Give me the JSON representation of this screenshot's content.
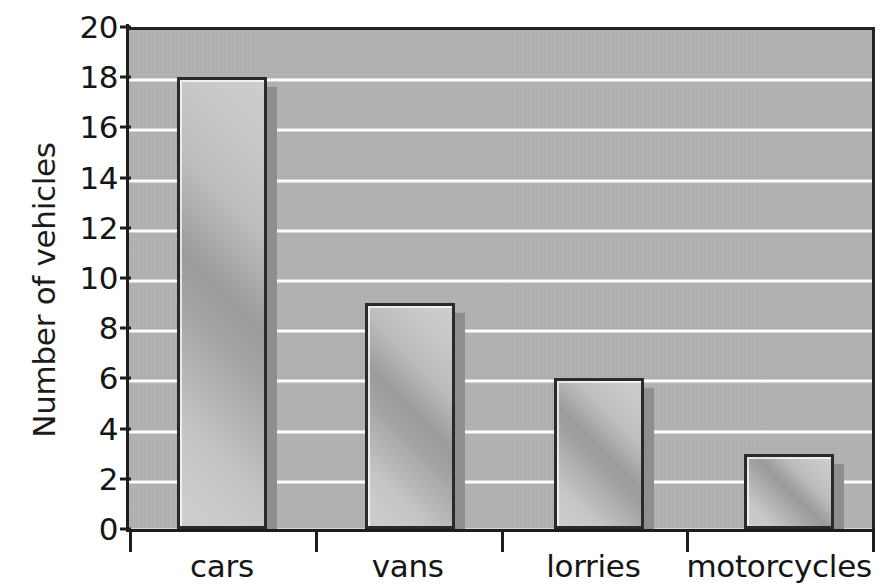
{
  "chart_data": {
    "type": "bar",
    "title": "",
    "xlabel": "",
    "ylabel": "Number of vehicles",
    "categories": [
      "cars",
      "vans",
      "lorries",
      "motorcycles"
    ],
    "values": [
      18,
      9,
      6,
      3
    ],
    "ylim": [
      0,
      20
    ],
    "ytick_step": 2,
    "yticks": [
      0,
      2,
      4,
      6,
      8,
      10,
      12,
      14,
      16,
      18,
      20
    ],
    "ytick_labels": [
      "0",
      "2",
      "4",
      "6",
      "8",
      "10",
      "12",
      "14",
      "16",
      "18",
      "20"
    ],
    "grid": true,
    "grid_axis": "y",
    "grid_color": "#fdfdfd",
    "legend": false,
    "plot_background": "#b4b4b4",
    "page_background": "#ffffff",
    "bar_border_color": "#2a2a2a",
    "bar_fill_light": "#cfcfcf",
    "bar_fill_dark": "#9b9b9b",
    "bar_shadow_color": "#8e8e8e",
    "axis_color": "#1d1d1d",
    "text_color": "#151515"
  }
}
